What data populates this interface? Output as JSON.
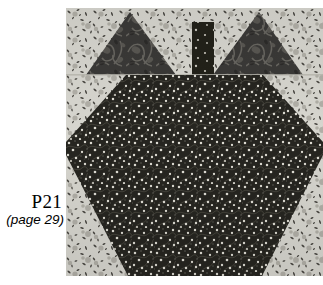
{
  "figure": {
    "caption_code": "P21",
    "caption_page": "(page 29)",
    "background_color": "#ffffff",
    "text_color": "#000000"
  },
  "quilt_block": {
    "name": "pumpkin-quilt-block",
    "x": 66,
    "y": 8,
    "width": 257,
    "height": 268,
    "patches": [
      {
        "name": "background-fabric",
        "role": "background",
        "fabric": "light-speckled-print",
        "base_color": "#d5d4cd",
        "speck_color": "#3a3a36"
      },
      {
        "name": "leaf-triangle-left",
        "role": "leaf",
        "fabric": "dark-damask-floral-print",
        "base_color": "#3b3a38",
        "motif_color": "#5e5c58"
      },
      {
        "name": "leaf-triangle-right",
        "role": "leaf",
        "fabric": "dark-damask-floral-print",
        "base_color": "#3b3a38",
        "motif_color": "#5e5c58"
      },
      {
        "name": "stem-rectangle",
        "role": "stem",
        "fabric": "dark-dotted-print",
        "base_color": "#24231f",
        "dot_color": "#cfcdc6"
      },
      {
        "name": "body-octagon",
        "role": "body",
        "fabric": "dark-dotted-vine-print",
        "base_color": "#26251f",
        "dot_color": "#d8d6cd"
      }
    ],
    "seam_line_y": 67
  }
}
